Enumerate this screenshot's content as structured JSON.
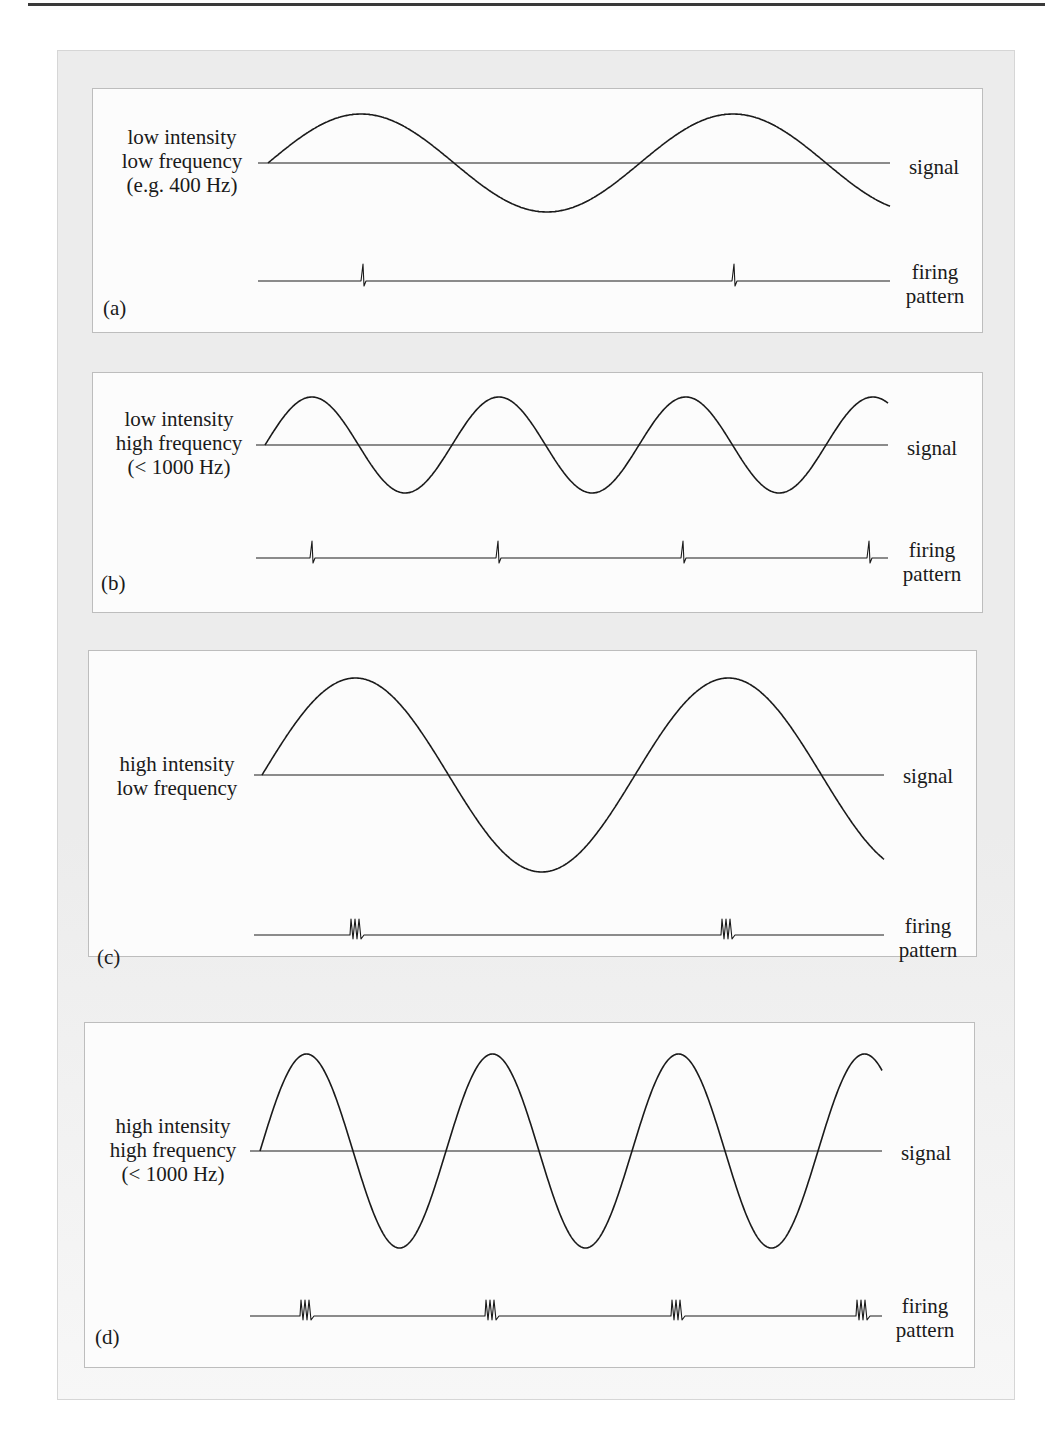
{
  "figure": {
    "panels": [
      {
        "id": "a",
        "tag": "(a)",
        "condition_lines": [
          "low intensity",
          "low frequency",
          "(e.g. 400 Hz)"
        ],
        "intensity": "low",
        "frequency": "low",
        "frequency_note": "(e.g. 400 Hz)",
        "signal_label": "signal",
        "firing_label_lines": [
          "firing",
          "pattern"
        ],
        "firing_type": "single spike per cycle",
        "spikes_per_burst": 1,
        "cycles_shown": 1.7,
        "firing_events": 2
      },
      {
        "id": "b",
        "tag": "(b)",
        "condition_lines": [
          "low intensity",
          "high frequency",
          "(< 1000 Hz)"
        ],
        "intensity": "low",
        "frequency": "high",
        "frequency_note": "(< 1000 Hz)",
        "signal_label": "signal",
        "firing_label_lines": [
          "firing",
          "pattern"
        ],
        "firing_type": "single spike per cycle",
        "spikes_per_burst": 1,
        "cycles_shown": 3.4,
        "firing_events": 4
      },
      {
        "id": "c",
        "tag": "(c)",
        "condition_lines": [
          "high intensity",
          "low frequency"
        ],
        "intensity": "high",
        "frequency": "low",
        "frequency_note": "",
        "signal_label": "signal",
        "firing_label_lines": [
          "firing",
          "pattern"
        ],
        "firing_type": "burst of spikes per cycle",
        "spikes_per_burst": 3,
        "cycles_shown": 1.7,
        "firing_events": 2
      },
      {
        "id": "d",
        "tag": "(d)",
        "condition_lines": [
          "high intensity",
          "high frequency",
          "(< 1000 Hz)"
        ],
        "intensity": "high",
        "frequency": "high",
        "frequency_note": "(< 1000 Hz)",
        "signal_label": "signal",
        "firing_label_lines": [
          "firing",
          "pattern"
        ],
        "firing_type": "burst of spikes per cycle",
        "spikes_per_burst": 3,
        "cycles_shown": 3.4,
        "firing_events": 4
      }
    ]
  },
  "colors": {
    "ink": "#1a1a1a",
    "frame": "#ececec",
    "panel": "#fcfcfc",
    "panel_border": "#bdbdbd"
  }
}
